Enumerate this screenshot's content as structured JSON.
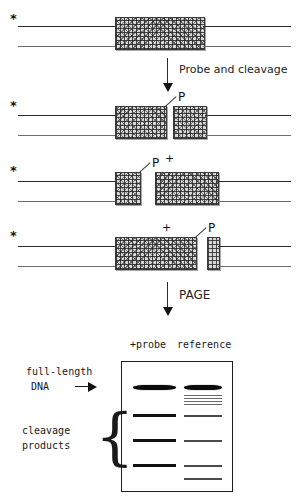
{
  "figure": {
    "labels": {
      "radiolabel": "*",
      "phosphate": "P",
      "plus": "+"
    },
    "steps": [
      {
        "id": "step-1",
        "arrow_text": "Probe and cleavage"
      },
      {
        "id": "step-2",
        "arrow_text": "PAGE"
      }
    ]
  },
  "panels": [
    {
      "name": "intact-duplex",
      "star": "*",
      "blocks": [
        "full-probe"
      ],
      "phosphate": null
    },
    {
      "name": "cleaved-two-fragments",
      "star": "*",
      "blocks": [
        "left-fragment",
        "right-fragment"
      ],
      "phosphate": "P"
    },
    {
      "name": "cleaved-short-left",
      "star": "*",
      "blocks": [
        "short-left-fragment",
        "long-right-fragment"
      ],
      "phosphate": "P",
      "plus": "+"
    },
    {
      "name": "cleaved-long-left",
      "star": "*",
      "blocks": [
        "long-left-fragment",
        "tiny-right-fragment"
      ],
      "phosphate": "P",
      "plus": "+"
    }
  ],
  "gel": {
    "lane_headers": [
      "+probe",
      "reference"
    ],
    "left_labels": {
      "full_length_line1": "full-length",
      "full_length_line2": "DNA",
      "cleavage_line1": "cleavage",
      "cleavage_line2": "products"
    },
    "lanes": [
      {
        "name": "+probe",
        "bands": [
          {
            "label": "full-length DNA",
            "y_pct": 21,
            "intensity": "strong-fuzzy"
          },
          {
            "label": "cleavage product 1",
            "y_pct": 42,
            "intensity": "strong"
          },
          {
            "label": "cleavage product 2",
            "y_pct": 61,
            "intensity": "strong"
          },
          {
            "label": "cleavage product 3",
            "y_pct": 80,
            "intensity": "strong"
          }
        ]
      },
      {
        "name": "reference",
        "bands": [
          {
            "label": "full-length DNA",
            "y_pct": 21,
            "intensity": "strong-fuzzy"
          },
          {
            "label": "ladder 1",
            "y_pct": 28,
            "intensity": "faint"
          },
          {
            "label": "ladder 2",
            "y_pct": 31,
            "intensity": "faint"
          },
          {
            "label": "ladder 3",
            "y_pct": 34,
            "intensity": "faint"
          },
          {
            "label": "ladder 4",
            "y_pct": 37,
            "intensity": "faint"
          },
          {
            "label": "marker 1",
            "y_pct": 43,
            "intensity": "medium"
          },
          {
            "label": "marker 2",
            "y_pct": 61,
            "intensity": "medium"
          },
          {
            "label": "marker 3",
            "y_pct": 80,
            "intensity": "medium"
          },
          {
            "label": "marker 4",
            "y_pct": 90,
            "intensity": "medium"
          }
        ]
      }
    ]
  },
  "colors": {
    "ink": "#1a1a1a",
    "strand_top": "#2b2b2b",
    "strand_bottom": "#6d6d6d",
    "block_fill": "#d6d6d6",
    "band": "#111111"
  }
}
